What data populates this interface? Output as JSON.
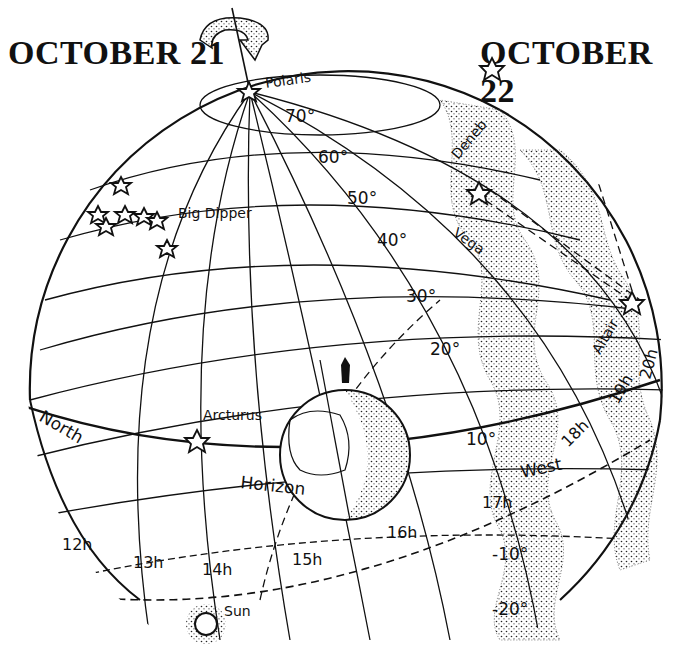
{
  "titles": {
    "left": "OCTOBER 21",
    "right": "OCTOBER 22"
  },
  "stars": {
    "polaris": "Polaris",
    "big_dipper": "Big Dipper",
    "deneb": "Deneb",
    "vega": "Vega",
    "altair": "Altair",
    "arcturus": "Arcturus",
    "sun": "Sun"
  },
  "declination_labels": [
    "70°",
    "60°",
    "50°",
    "40°",
    "30°",
    "20°",
    "10°",
    "10°",
    "-10°",
    "-20°"
  ],
  "hour_labels": [
    "12h",
    "13h",
    "14h",
    "15h",
    "16h",
    "17h",
    "17h",
    "18h",
    "19h",
    "20h"
  ],
  "horizon_labels": {
    "north": "North",
    "horizon": "Horizon",
    "west": "West"
  },
  "colors": {
    "ink": "#111111",
    "paper": "#ffffff"
  }
}
